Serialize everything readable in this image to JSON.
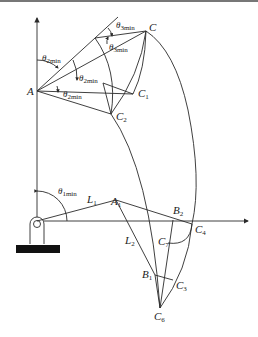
{
  "diagram": {
    "type": "planar-linkage-workspace",
    "points": {
      "A": {
        "label": "A",
        "sub": ""
      },
      "C": {
        "label": "C",
        "sub": ""
      },
      "C1": {
        "label": "C",
        "sub": "1"
      },
      "C2": {
        "label": "C",
        "sub": "2"
      },
      "A1": {
        "label": "A",
        "sub": "1"
      },
      "B1": {
        "label": "B",
        "sub": "1"
      },
      "B2": {
        "label": "B",
        "sub": "2"
      },
      "C3": {
        "label": "C",
        "sub": "3"
      },
      "C4": {
        "label": "C",
        "sub": "4"
      },
      "C6": {
        "label": "C",
        "sub": "6"
      },
      "C7": {
        "label": "C",
        "sub": "7"
      }
    },
    "links": {
      "L1": {
        "label": "L",
        "sub": "1"
      },
      "L2": {
        "label": "L",
        "sub": "2"
      }
    },
    "angles": {
      "theta1min": {
        "label": "θ",
        "sub": "1min"
      },
      "theta2min_a": {
        "label": "θ",
        "sub": "2min"
      },
      "theta2min_b": {
        "label": "θ",
        "sub": "2min"
      },
      "theta2min_c": {
        "label": "θ",
        "sub": "2min"
      },
      "theta3min_a": {
        "label": "θ",
        "sub": "3min"
      },
      "theta3min_b": {
        "label": "θ",
        "sub": "3min"
      }
    }
  }
}
